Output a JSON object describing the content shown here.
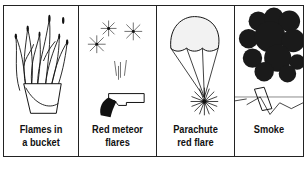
{
  "panels": [
    {
      "id": "flames",
      "icon": "flames-bucket-icon",
      "caption_line1": "Flames in",
      "caption_line2": "a bucket"
    },
    {
      "id": "meteor",
      "icon": "flare-gun-icon",
      "caption_line1": "Red meteor",
      "caption_line2": "flares"
    },
    {
      "id": "parachute",
      "icon": "parachute-flare-icon",
      "caption_line1": "Parachute",
      "caption_line2": "red flare"
    },
    {
      "id": "smoke",
      "icon": "smoke-icon",
      "caption_line1": "Smoke",
      "caption_line2": ""
    }
  ],
  "colors": {
    "ink": "#111111",
    "border": "#222222",
    "background": "#ffffff"
  }
}
